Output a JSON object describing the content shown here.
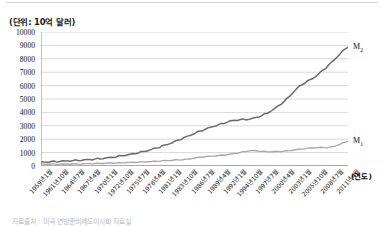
{
  "unit_label": "(단위: 10억 달러)",
  "xaxis_name": "(연도)",
  "footnote": "자료출처 : 미국 연방준비제도이사회 자료실",
  "series_tags": {
    "m2": "M",
    "m2_sub": "2",
    "m1": "M",
    "m1_sub": "1"
  },
  "chart_data": {
    "type": "line",
    "title": "",
    "subtitle": "",
    "xlabel": "(연도)",
    "ylabel": "(단위: 10억 달러)",
    "ylim": [
      0,
      10000
    ],
    "ytick_step": 1000,
    "yticks": [
      0,
      1000,
      2000,
      3000,
      4000,
      5000,
      6000,
      7000,
      8000,
      9000,
      10000
    ],
    "ytick_labels": [
      "0",
      "1000",
      "2000",
      "3000",
      "4000",
      "5000",
      "6000",
      "7000",
      "8000",
      "9000",
      "10000"
    ],
    "grid": true,
    "grid_axis": "y",
    "legend": "inline-end-labels",
    "legend_entries": [
      "M₂",
      "M₁"
    ],
    "categories": [
      "1959년1월",
      "1961년10월",
      "1964년7월",
      "1967년4월",
      "1970년1월",
      "1972년10월",
      "1975년7월",
      "1978년4월",
      "1981년1월",
      "1983년10월",
      "1986년7월",
      "1989년4월",
      "1992년1월",
      "1994년10월",
      "1997년7월",
      "2000년4월",
      "2003년1월",
      "2005년10월",
      "2008년7월",
      "2011년4월"
    ],
    "series": [
      {
        "name": "M₂",
        "color": "#6b6b6b",
        "values": [
          290,
          340,
          400,
          480,
          590,
          760,
          980,
          1290,
          1690,
          2180,
          2670,
          3080,
          3420,
          3520,
          3950,
          4770,
          5950,
          6690,
          7750,
          8850
        ]
      },
      {
        "name": "M₁",
        "color": "#a8a8a8",
        "values": [
          140,
          145,
          155,
          175,
          210,
          245,
          285,
          345,
          420,
          500,
          680,
          780,
          930,
          1140,
          1070,
          1100,
          1250,
          1370,
          1420,
          1830
        ]
      }
    ]
  }
}
